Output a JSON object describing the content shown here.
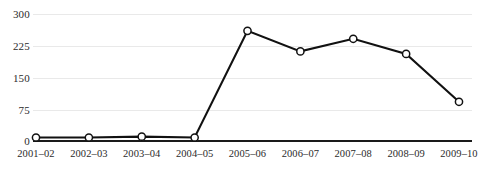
{
  "chart_data": {
    "type": "line",
    "title": "",
    "xlabel": "",
    "ylabel": "",
    "categories": [
      "2001–02",
      "2002–03",
      "2003–04",
      "2004–05",
      "2005–06",
      "2006–07",
      "2007–08",
      "2008–09",
      "2009–10"
    ],
    "values": [
      6,
      6,
      8,
      6,
      260,
      211,
      241,
      205,
      91
    ],
    "yticks": [
      0,
      75,
      150,
      225,
      300
    ],
    "ytick_labels": [
      "0",
      "75",
      "150",
      "225",
      "300"
    ],
    "ylim": [
      0,
      300
    ],
    "grid": true,
    "legend": false,
    "series": [
      {
        "name": "series-1",
        "values": [
          6,
          6,
          8,
          6,
          260,
          211,
          241,
          205,
          91
        ],
        "marker": "open-circle",
        "color": "#111111"
      }
    ],
    "colors": {
      "line": "#111111",
      "marker_fill": "#ffffff",
      "marker_stroke": "#111111",
      "gridline": "#e9e9e9",
      "axis": "#1a1a1a",
      "text": "#2b2b2b",
      "background": "#ffffff"
    }
  }
}
